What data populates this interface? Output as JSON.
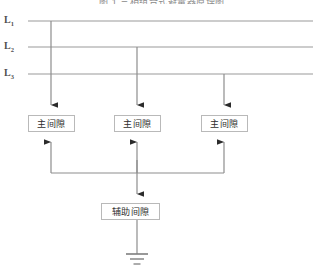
{
  "figure": {
    "title": "图 1  三相组合式避雷器原理图",
    "background_color": "#ffffff",
    "line_color": "#9a9a9a",
    "arrow_color": "#2b2b2b",
    "box_border_color": "#b9b9b9",
    "text_color": "#2e2e2e"
  },
  "phase_lines": [
    {
      "label": "L",
      "subscript": "1",
      "name": "phase-line-l1",
      "y": 21,
      "x_start": 28,
      "x_end": 313,
      "drop_x": 51
    },
    {
      "label": "L",
      "subscript": "2",
      "name": "phase-line-l2",
      "y": 47,
      "x_start": 28,
      "x_end": 313,
      "drop_x": 137
    },
    {
      "label": "L",
      "subscript": "3",
      "name": "phase-line-l3",
      "y": 74,
      "x_start": 28,
      "x_end": 313,
      "drop_x": 224
    }
  ],
  "main_gaps": [
    {
      "label": "主间隙",
      "name": "main-gap-1",
      "x": 28,
      "y": 115,
      "width": 47,
      "height": 17
    },
    {
      "label": "主间隙",
      "name": "main-gap-2",
      "x": 114,
      "y": 115,
      "width": 47,
      "height": 17
    },
    {
      "label": "主间隙",
      "name": "main-gap-3",
      "x": 201,
      "y": 115,
      "width": 47,
      "height": 17
    }
  ],
  "auxiliary_gap": {
    "label": "辅助间隙",
    "name": "auxiliary-gap",
    "x": 101,
    "y": 203,
    "width": 59,
    "height": 17
  },
  "bus": {
    "name": "common-bus",
    "y": 173,
    "x_start": 51,
    "x_end": 224
  },
  "ground": {
    "name": "ground-symbol",
    "x": 137,
    "y_top": 220,
    "y_bar": 254,
    "bar_widths": [
      22,
      14,
      7
    ],
    "bar_gap": 4
  }
}
